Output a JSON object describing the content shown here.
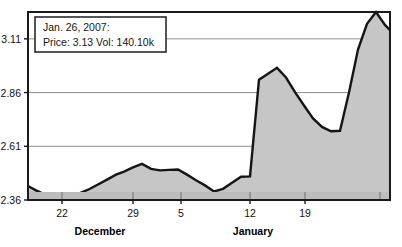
{
  "tooltip": {
    "line1": "Jan. 26, 2007:",
    "line2": "Price: 3.13 Vol: 140.10k",
    "date": "Jan. 26, 2007",
    "price": "3.13",
    "volume": "140.10k",
    "background": "#ffffff",
    "border": "#2b2b2b"
  },
  "style": {
    "area_fill": "#c6c6c6",
    "line_stroke": "#151515",
    "grid_color": "#8e8e8e",
    "frame_color": "#1a1a1a",
    "volume_fill": "#bdbdbd",
    "plot_background": "#ffffff"
  },
  "chart_data": {
    "type": "area",
    "title": "",
    "subtitle": "",
    "xlabel": "",
    "ylabel": "",
    "grid": true,
    "legend": "none",
    "ylim": [
      2.36,
      3.235
    ],
    "yticks": [
      "2.36",
      "2.61",
      "2.86",
      "3.11"
    ],
    "ytick_values": [
      2.36,
      2.61,
      2.86,
      3.11
    ],
    "xticks": [
      "22",
      "29",
      "5",
      "12",
      "19"
    ],
    "xtick_positions": [
      62,
      133,
      181,
      250,
      305
    ],
    "month_labels": [
      {
        "label": "December",
        "x": 100
      },
      {
        "label": "January",
        "x": 253
      }
    ],
    "x": [
      28,
      36,
      45,
      54,
      62,
      71,
      80,
      89,
      98,
      107,
      116,
      124,
      133,
      142,
      151,
      160,
      169,
      178,
      187,
      196,
      205,
      214,
      223,
      232,
      241,
      250,
      259,
      268,
      277,
      286,
      295,
      304,
      313,
      322,
      331,
      340,
      349,
      358,
      367,
      376,
      385,
      390
    ],
    "values": [
      2.425,
      2.405,
      2.385,
      2.368,
      2.36,
      2.378,
      2.392,
      2.41,
      2.432,
      2.455,
      2.478,
      2.492,
      2.512,
      2.528,
      2.505,
      2.498,
      2.5,
      2.502,
      2.478,
      2.452,
      2.428,
      2.4,
      2.412,
      2.44,
      2.468,
      2.47,
      2.92,
      2.948,
      2.975,
      2.93,
      2.862,
      2.8,
      2.74,
      2.7,
      2.68,
      2.682,
      2.86,
      3.06,
      3.18,
      3.235,
      3.175,
      3.15
    ],
    "annotations": [
      {
        "text": "Jan. 26, 2007: Price: 3.13 Vol: 140.10k",
        "type": "tooltip"
      }
    ],
    "volume_strip": {
      "present": true,
      "separator_positions": [
        62,
        133,
        181,
        250,
        305,
        380
      ]
    }
  }
}
